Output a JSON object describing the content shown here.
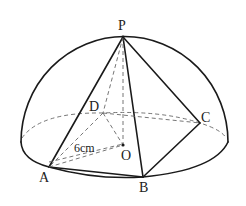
{
  "figure": {
    "type": "hemisphere with inscribed pyramid P-ABCD",
    "labels": {
      "P": "P",
      "A": "A",
      "B": "B",
      "C": "C",
      "D": "D",
      "O": "O"
    },
    "radius_label": "6cm",
    "colors": {
      "line": "#1a1a1a",
      "hidden_line": "#666666",
      "background": "#ffffff"
    }
  }
}
